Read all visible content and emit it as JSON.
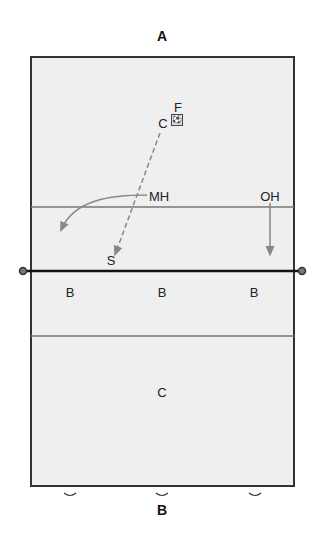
{
  "diagram": {
    "top_team_label": "A",
    "bottom_team_label": "B",
    "court": {
      "background": "#efefef",
      "border_color": "#333333",
      "attack_line_color": "#777777",
      "net_color": "#111111"
    },
    "players_side_a": [
      {
        "label": "F",
        "x": 178,
        "y": 107
      },
      {
        "label": "C",
        "x": 163,
        "y": 123
      },
      {
        "label": "MH",
        "x": 159,
        "y": 196
      },
      {
        "label": "OH",
        "x": 270,
        "y": 196
      },
      {
        "label": "S",
        "x": 111,
        "y": 260
      }
    ],
    "players_side_b": [
      {
        "label": "B",
        "x": 70,
        "y": 292
      },
      {
        "label": "B",
        "x": 162,
        "y": 292
      },
      {
        "label": "B",
        "x": 254,
        "y": 292
      },
      {
        "label": "C",
        "x": 162,
        "y": 392
      }
    ],
    "ball_icon": "volleyball",
    "movements": [
      {
        "from": "C",
        "to": "S",
        "style": "dashed",
        "meaning": "set path"
      },
      {
        "from": "MH",
        "to": "left-front",
        "style": "solid-curve"
      },
      {
        "from": "OH",
        "to": "net",
        "style": "solid"
      }
    ],
    "bottom_markers": [
      {
        "x": 70,
        "y": 494
      },
      {
        "x": 162,
        "y": 494
      },
      {
        "x": 255,
        "y": 494
      }
    ]
  }
}
